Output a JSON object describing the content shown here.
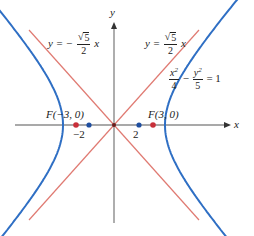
{
  "diagram": {
    "type": "hyperbola",
    "equation": {
      "lhs_term1_num": "x",
      "lhs_term1_sup": "2",
      "lhs_term1_den": "4",
      "minus": "−",
      "lhs_term2_num": "y",
      "lhs_term2_sup": "2",
      "lhs_term2_den": "5",
      "rhs": "= 1"
    },
    "asymptote_left": {
      "prefix": "y = −",
      "num_root": "5",
      "den": "2",
      "var": "x"
    },
    "asymptote_right": {
      "prefix": "y =",
      "num_root": "5",
      "den": "2",
      "var": "x"
    },
    "axes": {
      "x_label": "x",
      "y_label": "y"
    },
    "foci": [
      {
        "label": "F(−3, 0)",
        "x": -3,
        "y": 0
      },
      {
        "label": "F(3, 0)",
        "x": 3,
        "y": 0
      }
    ],
    "vertices": [
      {
        "label": "−2",
        "x": -2,
        "y": 0
      },
      {
        "label": "2",
        "x": 2,
        "y": 0
      }
    ],
    "colors": {
      "hyperbola": "#2f6fc4",
      "asymptote": "#e07a72",
      "axis": "#8c8c8c",
      "focus_point": "#c8303a",
      "vertex_point": "#1f4fa0",
      "text": "#222222"
    }
  }
}
